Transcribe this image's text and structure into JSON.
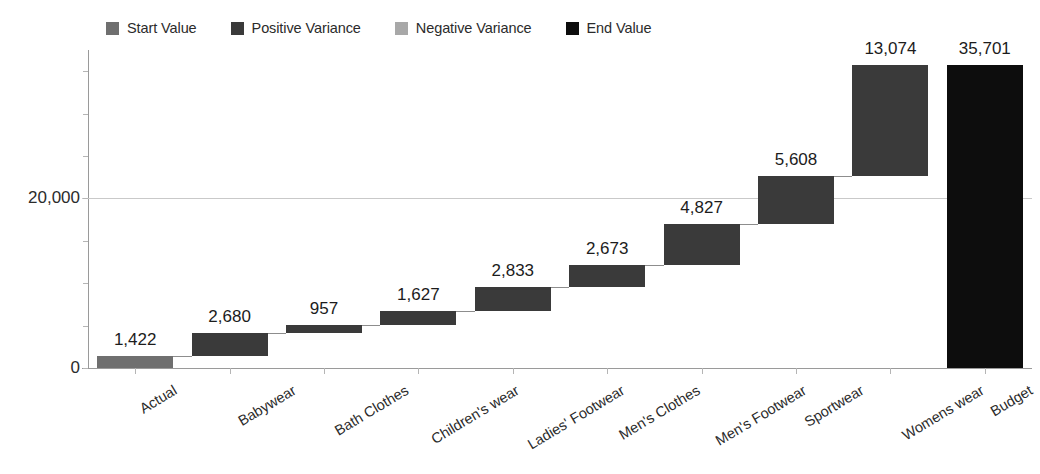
{
  "legend": {
    "items": [
      {
        "label": "Start Value",
        "color": "#6f6f6f",
        "icon": "square-swatch-icon"
      },
      {
        "label": "Positive Variance",
        "color": "#3a3a3a",
        "icon": "square-swatch-icon"
      },
      {
        "label": "Negative Variance",
        "color": "#a8a8a8",
        "icon": "square-swatch-icon"
      },
      {
        "label": "End Value",
        "color": "#0d0d0d",
        "icon": "square-swatch-icon"
      }
    ]
  },
  "axis": {
    "y_ticks": [
      "0",
      "20,000"
    ],
    "x_labels": [
      "Actual",
      "Babywear",
      "Bath Clothes",
      "Children's wear",
      "Ladies' Footwear",
      "Men's Clothes",
      "Men's Footwear",
      "Sportwear",
      "Womens wear",
      "Budget"
    ]
  },
  "bar_labels": [
    "1,422",
    "2,680",
    "957",
    "1,627",
    "2,833",
    "2,673",
    "4,827",
    "5,608",
    "13,074",
    "35,701"
  ],
  "chart_data": {
    "type": "bar",
    "chart_subtype": "waterfall",
    "title": "",
    "xlabel": "",
    "ylabel": "",
    "categories": [
      "Actual",
      "Babywear",
      "Bath Clothes",
      "Children's wear",
      "Ladies' Footwear",
      "Men's Clothes",
      "Men's Footwear",
      "Sportwear",
      "Womens wear",
      "Budget"
    ],
    "values": [
      1422,
      2680,
      957,
      1627,
      2833,
      2673,
      4827,
      5608,
      13074,
      35701
    ],
    "value_labels": [
      "1,422",
      "2,680",
      "957",
      "1,627",
      "2,833",
      "2,673",
      "4,827",
      "5,608",
      "13,074",
      "35,701"
    ],
    "bar_types": [
      "start",
      "positive",
      "positive",
      "positive",
      "positive",
      "positive",
      "positive",
      "positive",
      "positive",
      "end"
    ],
    "cumulative_base": [
      0,
      1422,
      4102,
      5059,
      6686,
      9519,
      12192,
      17019,
      22627,
      0
    ],
    "cumulative_top": [
      1422,
      4102,
      5059,
      6686,
      9519,
      12192,
      17019,
      22627,
      35701,
      35701
    ],
    "ylim": [
      0,
      37500
    ],
    "y_ticks": [
      0,
      20000
    ],
    "y_tick_labels": [
      "0",
      "20,000"
    ],
    "grid": true,
    "legend_position": "top-left",
    "series": [
      {
        "name": "Start Value",
        "values": [
          1422,
          null,
          null,
          null,
          null,
          null,
          null,
          null,
          null,
          null
        ]
      },
      {
        "name": "Positive Variance",
        "values": [
          null,
          2680,
          957,
          1627,
          2833,
          2673,
          4827,
          5608,
          13074,
          null
        ]
      },
      {
        "name": "Negative Variance",
        "values": [
          null,
          null,
          null,
          null,
          null,
          null,
          null,
          null,
          null,
          null
        ]
      },
      {
        "name": "End Value",
        "values": [
          null,
          null,
          null,
          null,
          null,
          null,
          null,
          null,
          null,
          35701
        ]
      }
    ],
    "colors": {
      "start": "#6f6f6f",
      "positive": "#3a3a3a",
      "negative": "#a8a8a8",
      "end": "#0d0d0d",
      "gridline": "#c9c9c9",
      "axis": "#9a9a9a",
      "text": "#1c1c1c"
    }
  }
}
